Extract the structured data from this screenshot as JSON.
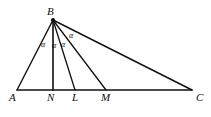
{
  "figure": {
    "type": "geometry-diagram",
    "background_color": "#ffffff",
    "stroke_color": "#111111",
    "canvas": {
      "width": 211,
      "height": 117
    }
  },
  "points": [
    {
      "id": "A",
      "label": "A",
      "x": 17,
      "y": 90,
      "label_x": 9,
      "label_y": 92
    },
    {
      "id": "B",
      "label": "B",
      "x": 53,
      "y": 20,
      "label_x": 47,
      "label_y": 6
    },
    {
      "id": "N",
      "label": "N",
      "x": 53,
      "y": 90,
      "label_x": 47,
      "label_y": 92
    },
    {
      "id": "L",
      "label": "L",
      "x": 75,
      "y": 90,
      "label_x": 72,
      "label_y": 92
    },
    {
      "id": "M",
      "label": "M",
      "x": 106,
      "y": 90,
      "label_x": 101,
      "label_y": 92
    },
    {
      "id": "C",
      "label": "C",
      "x": 192,
      "y": 90,
      "label_x": 196,
      "label_y": 92
    }
  ],
  "segments": [
    {
      "id": "base-AC",
      "from": "A",
      "to": "C",
      "x1": 17,
      "y1": 90,
      "x2": 192,
      "y2": 90
    },
    {
      "id": "side-BA",
      "from": "B",
      "to": "A",
      "x1": 53,
      "y1": 20,
      "x2": 17,
      "y2": 90
    },
    {
      "id": "cevian-BN",
      "from": "B",
      "to": "N",
      "x1": 53,
      "y1": 20,
      "x2": 53,
      "y2": 90
    },
    {
      "id": "cevian-BL",
      "from": "B",
      "to": "L",
      "x1": 53,
      "y1": 20,
      "x2": 75,
      "y2": 90
    },
    {
      "id": "cevian-BM",
      "from": "B",
      "to": "M",
      "x1": 53,
      "y1": 20,
      "x2": 106,
      "y2": 90
    },
    {
      "id": "side-BC",
      "from": "B",
      "to": "C",
      "x1": 53,
      "y1": 20,
      "x2": 192,
      "y2": 90
    }
  ],
  "angles": [
    {
      "id": "angle-ABN",
      "label": "α",
      "x": 41,
      "y": 41
    },
    {
      "id": "angle-NBL",
      "label": "α",
      "x": 52,
      "y": 42
    },
    {
      "id": "angle-LBM",
      "label": "α",
      "x": 61,
      "y": 41
    },
    {
      "id": "angle-MBC",
      "label": "α",
      "x": 69,
      "y": 32
    }
  ]
}
